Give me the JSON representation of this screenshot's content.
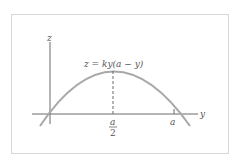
{
  "diagram": {
    "equation": "z = ky(a − y)",
    "axes": {
      "vertical": "z",
      "horizontal": "y"
    },
    "ticks": {
      "midpoint_numerator": "a",
      "midpoint_denominator": "2",
      "end": "a"
    },
    "colors": {
      "curve": "#a8a8a8",
      "axes": "#6a6a6a",
      "frame": "#d8d8d8",
      "text": "#555555"
    }
  }
}
